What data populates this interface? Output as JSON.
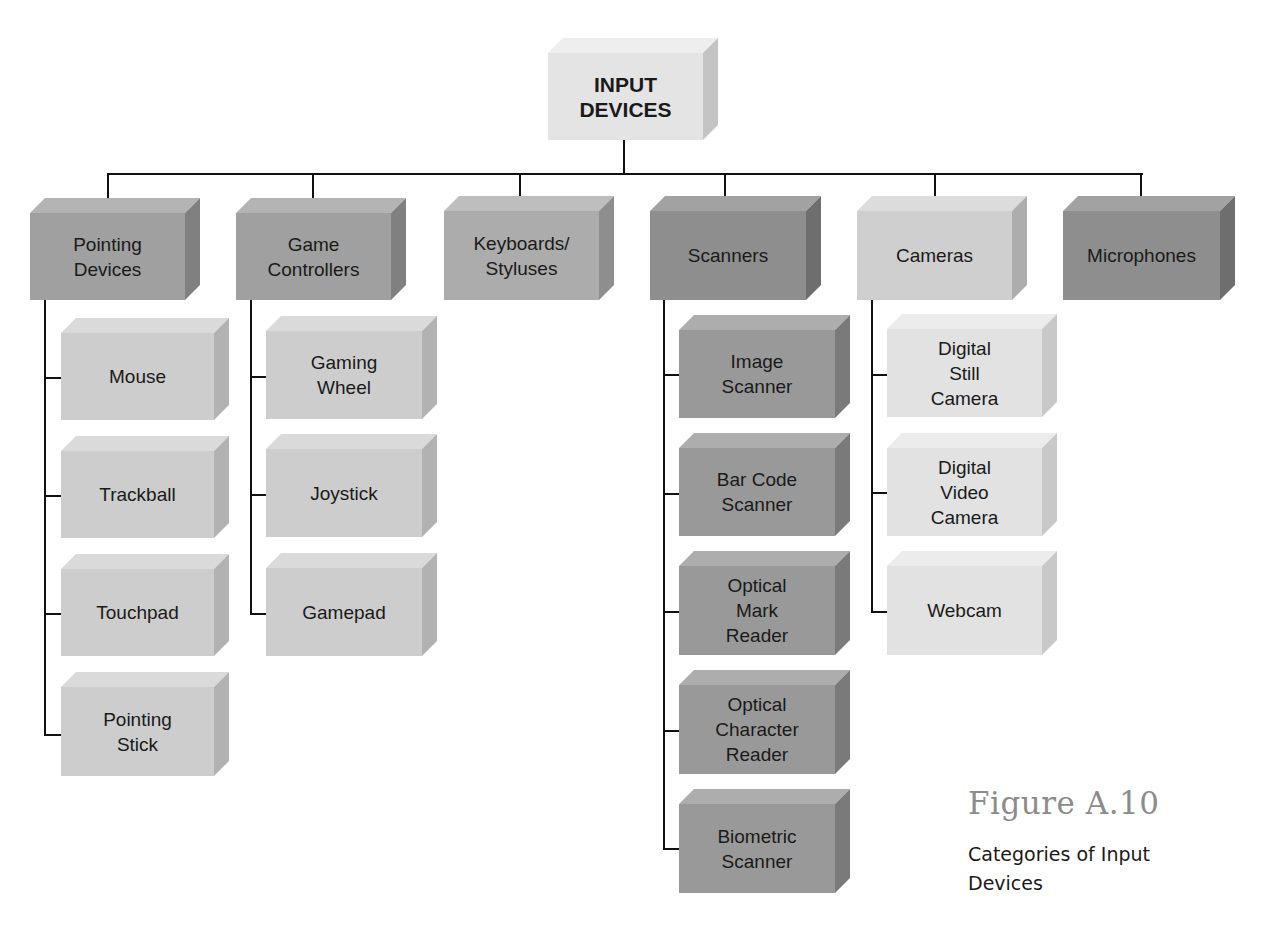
{
  "diagram": {
    "type": "hierarchy",
    "root": {
      "label": "INPUT\nDEVICES",
      "line1": "INPUT",
      "line2": "DEVICES"
    },
    "categories": [
      {
        "label": "Pointing Devices",
        "lines": [
          "Pointing",
          "Devices"
        ],
        "shade": "medium",
        "children": [
          {
            "lines": [
              "Mouse"
            ]
          },
          {
            "lines": [
              "Trackball"
            ]
          },
          {
            "lines": [
              "Touchpad"
            ]
          },
          {
            "lines": [
              "Pointing",
              "Stick"
            ]
          }
        ]
      },
      {
        "label": "Game Controllers",
        "lines": [
          "Game",
          "Controllers"
        ],
        "shade": "medium",
        "children": [
          {
            "lines": [
              "Gaming",
              "Wheel"
            ]
          },
          {
            "lines": [
              "Joystick"
            ]
          },
          {
            "lines": [
              "Gamepad"
            ]
          }
        ]
      },
      {
        "label": "Keyboards/Styluses",
        "lines": [
          "Keyboards/",
          "Styluses"
        ],
        "shade": "light-medium",
        "children": []
      },
      {
        "label": "Scanners",
        "lines": [
          "Scanners"
        ],
        "shade": "dark",
        "children": [
          {
            "lines": [
              "Image",
              "Scanner"
            ]
          },
          {
            "lines": [
              "Bar Code",
              "Scanner"
            ]
          },
          {
            "lines": [
              "Optical",
              "Mark",
              "Reader"
            ]
          },
          {
            "lines": [
              "Optical",
              "Character",
              "Reader"
            ]
          },
          {
            "lines": [
              "Biometric",
              "Scanner"
            ]
          }
        ]
      },
      {
        "label": "Cameras",
        "lines": [
          "Cameras"
        ],
        "shade": "light",
        "children": [
          {
            "lines": [
              "Digital",
              "Still",
              "Camera"
            ]
          },
          {
            "lines": [
              "Digital",
              "Video",
              "Camera"
            ]
          },
          {
            "lines": [
              "Webcam"
            ]
          }
        ]
      },
      {
        "label": "Microphones",
        "lines": [
          "Microphones"
        ],
        "shade": "dark",
        "children": []
      }
    ]
  },
  "colors": {
    "root": {
      "front": "#e4e4e4",
      "top": "#eeeeee",
      "side": "#c4c4c4"
    },
    "dark": {
      "front": "#8e8e8e",
      "top": "#a2a2a2",
      "side": "#6e6e6e"
    },
    "medium": {
      "front": "#a0a0a0",
      "top": "#b4b4b4",
      "side": "#808080"
    },
    "light-medium": {
      "front": "#acacac",
      "top": "#bebebe",
      "side": "#8e8e8e"
    },
    "light": {
      "front": "#cfcfcf",
      "top": "#dcdcdc",
      "side": "#adadad"
    },
    "child-light": {
      "front": "#cdcdcd",
      "top": "#dadada",
      "side": "#b2b2b2"
    },
    "child-dark": {
      "front": "#999999",
      "top": "#adadad",
      "side": "#7a7a7a"
    },
    "child-lightest": {
      "front": "#e2e2e2",
      "top": "#ececec",
      "side": "#c8c8c8"
    },
    "line": "#111111",
    "caption_figure": "#8c8c8c"
  },
  "caption": {
    "figure_number": "Figure A.10",
    "title": "Categories of Input Devices"
  }
}
